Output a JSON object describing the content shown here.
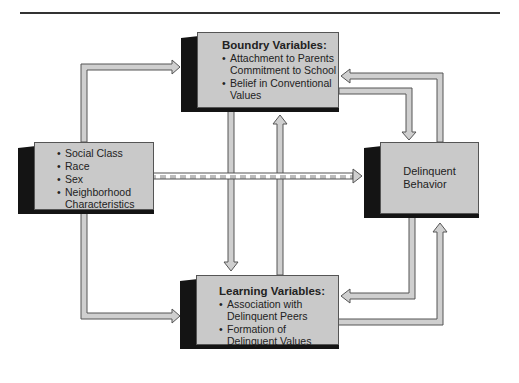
{
  "diagram": {
    "boxes": {
      "boundary": {
        "title": "Boundry Variables:",
        "items": [
          "Attachment to Parents",
          "Commitment to School",
          "Belief in Conventional",
          "Values"
        ]
      },
      "background": {
        "items": [
          "Social Class",
          "Race",
          "Sex",
          "Neighborhood",
          "Characteristics"
        ]
      },
      "outcome": {
        "line1": "Delinquent",
        "line2": "Behavior"
      },
      "learning": {
        "title": "Learning Variables:",
        "items": [
          "Association with",
          "Delinquent Peers",
          "Formation of",
          "Delinquent Values"
        ]
      }
    },
    "colors": {
      "box_face": "#c9c9c9",
      "box_side": "#141414",
      "arrow_fill": "#cfcfcf",
      "arrow_stroke": "#555555"
    }
  }
}
